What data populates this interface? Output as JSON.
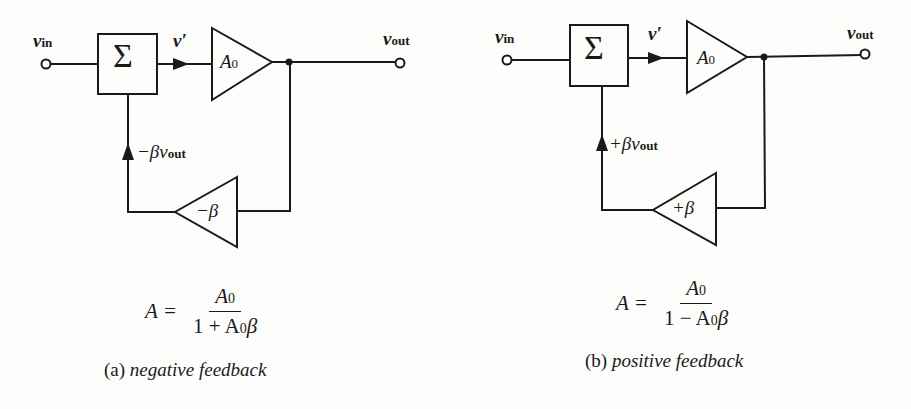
{
  "figure": {
    "panels": [
      {
        "id": "a",
        "input_label": "v",
        "input_sub": "in",
        "summer_symbol": "Σ",
        "intermediate_label": "v′",
        "forward_gain_label": "A",
        "forward_gain_sub": "0",
        "output_label": "v",
        "output_sub": "out",
        "feedback_gain_label": "−β",
        "feedback_signal_prefix": "−βv",
        "feedback_signal_sub": "out",
        "formula": {
          "lhs": "A =",
          "numerator_main": "A",
          "numerator_sub": "0",
          "denominator_prefix": "1 + A",
          "denominator_sub": "0",
          "denominator_suffix": "β"
        },
        "caption_tag": "(a)",
        "caption_text": "negative feedback"
      },
      {
        "id": "b",
        "input_label": "v",
        "input_sub": "in",
        "summer_symbol": "Σ",
        "intermediate_label": "v′",
        "forward_gain_label": "A",
        "forward_gain_sub": "0",
        "output_label": "v",
        "output_sub": "out",
        "feedback_gain_label": "+β",
        "feedback_signal_prefix": "+βv",
        "feedback_signal_sub": "out",
        "formula": {
          "lhs": "A =",
          "numerator_main": "A",
          "numerator_sub": "0",
          "denominator_prefix": "1 − A",
          "denominator_sub": "0",
          "denominator_suffix": "β"
        },
        "caption_tag": "(b)",
        "caption_text": "positive feedback"
      }
    ],
    "colors": {
      "ink": "#1a1a1a",
      "background": "#fdfdfb"
    }
  }
}
